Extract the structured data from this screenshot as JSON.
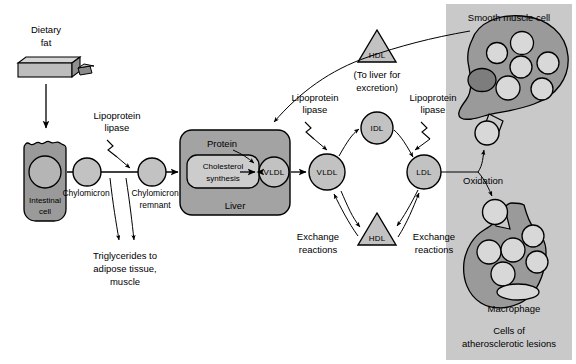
{
  "figure": {
    "colors": {
      "panel_bg": "#c9c9c9",
      "cell_fill": "#9a9a9a",
      "organ_fill": "#a3a3a3",
      "node_fill": "#c2c2c2",
      "vacuole_fill": "#d8d8d8",
      "dark_vacuole_fill": "#7d7d7d",
      "inner_box_fill": "#cccccc",
      "outline": "#000000",
      "background": "#ffffff"
    }
  },
  "left_pathway": {
    "dietary_fat_label": "Dietary\nfat",
    "dietary_fat_line1": "Dietary",
    "dietary_fat_line2": "fat",
    "intestinal_cell_line1": "Intestinal",
    "intestinal_cell_line2": "cell",
    "chylomicron_label": "Chylomicron",
    "chylomicron_remnant_line1": "Chylomicron",
    "chylomicron_remnant_line2": "remnant",
    "lipoprotein_lipase_line1": "Lipoprotein",
    "lipoprotein_lipase_line2": "lipase",
    "triglycerides_line1": "Triglycerides to",
    "triglycerides_line2": "adipose tissue,",
    "triglycerides_line3": "muscle"
  },
  "liver": {
    "organ_label": "Liver",
    "protein_label": "Protein",
    "cholesterol_synthesis_line1": "Cholesterol",
    "cholesterol_synthesis_line2": "synthesis",
    "vldl_label": "VLDL"
  },
  "cycle": {
    "vldl_label": "VLDL",
    "idl_label": "IDL",
    "ldl_label": "LDL",
    "hdl_label": "HDL",
    "lipase_left_line1": "Lipoprotein",
    "lipase_left_line2": "lipase",
    "lipase_right_line1": "Lipoprotein",
    "lipase_right_line2": "lipase",
    "exchange_left_line1": "Exchange",
    "exchange_left_line2": "reactions",
    "exchange_right_line1": "Exchange",
    "exchange_right_line2": "reactions",
    "oxidation_label": "Oxidation"
  },
  "hdl_excretion": {
    "hdl_label": "HDL",
    "note_line1": "(To liver for",
    "note_line2": "excretion)"
  },
  "right_panel": {
    "smooth_muscle_label": "Smooth muscle cell",
    "macrophage_label": "Macrophage",
    "caption_line1": "Cells of",
    "caption_line2": "atherosclerotic lesions",
    "smooth_muscle_vacuole_count": 7,
    "macrophage_vacuole_count": 6
  }
}
